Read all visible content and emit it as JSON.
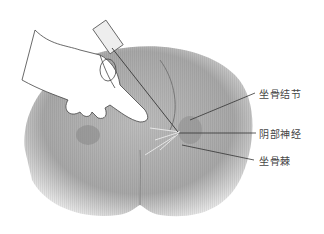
{
  "figure": {
    "labels": [
      {
        "id": "ischial-tuberosity",
        "text": "坐骨结节",
        "x": 259,
        "y": 86
      },
      {
        "id": "pudendal-nerve",
        "text": "阴部神经",
        "x": 259,
        "y": 126
      },
      {
        "id": "ischial-spine",
        "text": "坐骨棘",
        "x": 259,
        "y": 153
      }
    ],
    "colors": {
      "skin_shade": "#9a9a9a",
      "skin_light": "#d6d6d6",
      "line": "#333333",
      "glove": "#ffffff"
    }
  }
}
